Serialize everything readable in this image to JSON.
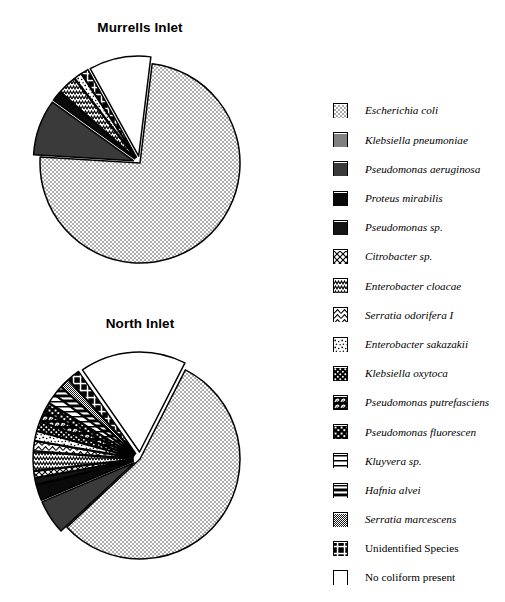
{
  "charts": [
    {
      "id": "murrells",
      "title": "Murrells Inlet",
      "center": [
        140,
        172
      ],
      "radius": 103
    },
    {
      "id": "north",
      "title": "North Inlet",
      "center": [
        140,
        468
      ],
      "radius": 103
    }
  ],
  "legend": {
    "items": [
      {
        "label": "Escherichia coli",
        "pattern": "dots-light",
        "italic": true,
        "icon": "legend-swatch-escherichia-coli"
      },
      {
        "label": "Klebsiella pneumoniae",
        "pattern": "gray-mid",
        "italic": true,
        "icon": "legend-swatch-klebsiella-pneumoniae"
      },
      {
        "label": "Pseudomonas aeruginosa",
        "pattern": "gray-dark",
        "italic": true,
        "icon": "legend-swatch-pseudomonas-aeruginosa"
      },
      {
        "label": "Proteus mirabilis",
        "pattern": "black",
        "italic": true,
        "icon": "legend-swatch-proteus-mirabilis"
      },
      {
        "label": "Pseudomonas sp.",
        "pattern": "black2",
        "italic": true,
        "icon": "legend-swatch-pseudomonas-sp"
      },
      {
        "label": "Citrobacter sp.",
        "pattern": "diag-cross",
        "italic": true,
        "icon": "legend-swatch-citrobacter-sp"
      },
      {
        "label": "Enterobacter cloacae",
        "pattern": "zigzag",
        "italic": true,
        "icon": "legend-swatch-enterobacter-cloacae"
      },
      {
        "label": "Serratia odorifera I",
        "pattern": "chevron",
        "italic": true,
        "icon": "legend-swatch-serratia-odorifera-i"
      },
      {
        "label": "Enterobacter  sakazakii",
        "pattern": "speckle",
        "italic": true,
        "icon": "legend-swatch-enterobacter-sakazakii"
      },
      {
        "label": "Klebsiella oxytoca",
        "pattern": "mesh",
        "italic": true,
        "icon": "legend-swatch-klebsiella-oxytoca"
      },
      {
        "label": "Pseudomonas putrefasciens",
        "pattern": "swirl",
        "italic": true,
        "icon": "legend-swatch-pseudomonas-putrefasciens"
      },
      {
        "label": "Pseudomonas fluorescen",
        "pattern": "blotch",
        "italic": true,
        "icon": "legend-swatch-pseudomonas-fluorescen"
      },
      {
        "label": "Kluyvera sp.",
        "pattern": "hbars",
        "italic": true,
        "icon": "legend-swatch-kluyvera-sp"
      },
      {
        "label": "Hafnia alvei",
        "pattern": "hbars-bold",
        "italic": true,
        "icon": "legend-swatch-hafnia-alvei"
      },
      {
        "label": "Serratia marcescens",
        "pattern": "diag-fine",
        "italic": true,
        "icon": "legend-swatch-serratia-marcescens"
      },
      {
        "label": "Unidentified Species",
        "pattern": "cross-bold",
        "italic": false,
        "icon": "legend-swatch-unidentified-species"
      },
      {
        "label": "No coliform present",
        "pattern": "white",
        "italic": false,
        "icon": "legend-swatch-no-coliform-present"
      }
    ]
  },
  "chart_data": [
    {
      "type": "pie",
      "title": "Murrells Inlet",
      "categories": [
        "Escherichia coli",
        "Klebsiella pneumoniae",
        "Pseudomonas aeruginosa",
        "Proteus mirabilis",
        "Pseudomonas sp.",
        "Citrobacter sp.",
        "Enterobacter cloacae",
        "Serratia odorifera I",
        "Enterobacter  sakazakii",
        "Klebsiella oxytoca",
        "Pseudomonas putrefasciens",
        "Pseudomonas fluorescen",
        "Kluyvera sp.",
        "Hafnia alvei",
        "Serratia marcescens",
        "Unidentified Species",
        "No coliform present"
      ],
      "values": [
        74.0,
        0.0,
        9.0,
        1.6,
        0.0,
        0.0,
        3.0,
        0.0,
        1.2,
        0.0,
        0.0,
        0.0,
        0.0,
        0.0,
        0.0,
        1.2,
        10.0
      ],
      "units": "percent",
      "legend_position": "right",
      "exploded": true
    },
    {
      "type": "pie",
      "title": "North Inlet",
      "categories": [
        "Escherichia coli",
        "Klebsiella pneumoniae",
        "Pseudomonas aeruginosa",
        "Proteus mirabilis",
        "Pseudomonas sp.",
        "Citrobacter sp.",
        "Enterobacter cloacae",
        "Serratia odorifera I",
        "Enterobacter  sakazakii",
        "Klebsiella oxytoca",
        "Pseudomonas putrefasciens",
        "Pseudomonas fluorescen",
        "Kluyvera sp.",
        "Hafnia alvei",
        "Serratia marcescens",
        "Unidentified Species",
        "No coliform present"
      ],
      "values": [
        55.0,
        0.0,
        5.5,
        2.5,
        1.0,
        1.0,
        3.0,
        1.5,
        1.5,
        1.5,
        1.5,
        1.5,
        1.5,
        1.5,
        1.5,
        2.0,
        17.0
      ],
      "units": "percent",
      "legend_position": "right",
      "exploded": true
    }
  ]
}
